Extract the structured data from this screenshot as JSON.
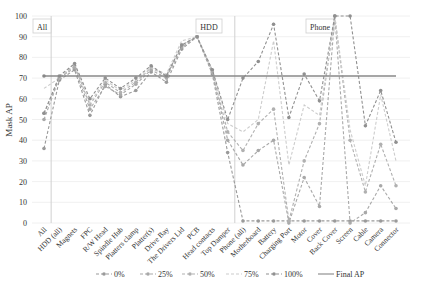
{
  "chart_data": {
    "type": "line",
    "title": "",
    "xlabel": "",
    "ylabel": "Mask AP",
    "ylim": [
      0,
      100
    ],
    "yticks": [
      0,
      10,
      20,
      30,
      40,
      50,
      60,
      70,
      80,
      90,
      100
    ],
    "grid": true,
    "legend_position": "bottom",
    "groups": [
      {
        "label": "All",
        "start": 0,
        "end": 0
      },
      {
        "label": "HDD",
        "start": 1,
        "end": 12
      },
      {
        "label": "Phone",
        "start": 13,
        "end": 23
      }
    ],
    "categories": [
      "All",
      "HDD (all)",
      "Magnets",
      "FPC",
      "R/W Head",
      "Spindle Hub",
      "Platters clamp",
      "Platter(s)",
      "Drive Bay",
      "The Drivers Lid",
      "PCB",
      "Head contacts",
      "Top Damper",
      "Phone (all)",
      "Motherboard",
      "Battery",
      "Charging Port",
      "Motor",
      "Cover",
      "Back Cover",
      "Screen",
      "Cable",
      "Camera",
      "Connector"
    ],
    "series": [
      {
        "name": "0%",
        "color": "#9a9a9a",
        "dash": "3,2",
        "marker": true,
        "values": [
          36,
          69,
          74,
          52,
          67,
          61,
          64,
          73,
          68,
          84,
          90,
          72,
          34,
          1,
          1,
          1,
          1,
          1,
          1,
          1,
          1,
          1,
          1,
          1
        ]
      },
      {
        "name": "25%",
        "color": "#a8a8a8",
        "dash": "3,2",
        "marker": true,
        "values": [
          50,
          70,
          75,
          55,
          66,
          62,
          67,
          74,
          70,
          85,
          90,
          73,
          40,
          28,
          35,
          40,
          0,
          22,
          8,
          100,
          0,
          5,
          18,
          7
        ]
      },
      {
        "name": "50%",
        "color": "#b0b0b0",
        "dash": "3,2",
        "marker": true,
        "values": [
          53,
          70,
          76,
          57,
          68,
          63,
          68,
          75,
          71,
          86,
          90,
          73,
          44,
          35,
          48,
          55,
          1,
          30,
          48,
          100,
          40,
          15,
          38,
          18
        ]
      },
      {
        "name": "75%",
        "color": "#cccccc",
        "dash": "3,2",
        "marker": false,
        "values": [
          65,
          70,
          77,
          58,
          69,
          64,
          69,
          75,
          72,
          88,
          90,
          74,
          48,
          44,
          50,
          88,
          28,
          57,
          52,
          100,
          45,
          18,
          62,
          30
        ]
      },
      {
        "name": "100%",
        "color": "#909090",
        "dash": "3,2",
        "marker": true,
        "values": [
          53,
          71,
          77,
          60,
          70,
          65,
          70,
          76,
          71,
          86,
          90,
          74,
          50,
          70,
          78,
          96,
          51,
          72,
          59,
          100,
          100,
          47,
          64,
          39
        ]
      },
      {
        "name": "Final AP",
        "color": "#888888",
        "dash": "",
        "marker": false,
        "values": [
          71,
          71,
          71,
          71,
          71,
          71,
          71,
          71,
          71,
          71,
          71,
          71,
          71,
          71,
          71,
          71,
          71,
          71,
          71,
          71,
          71,
          71,
          71,
          71
        ]
      }
    ]
  },
  "legend": {
    "items": [
      "0%",
      "25%",
      "50%",
      "75%",
      "100%",
      "Final AP"
    ]
  }
}
